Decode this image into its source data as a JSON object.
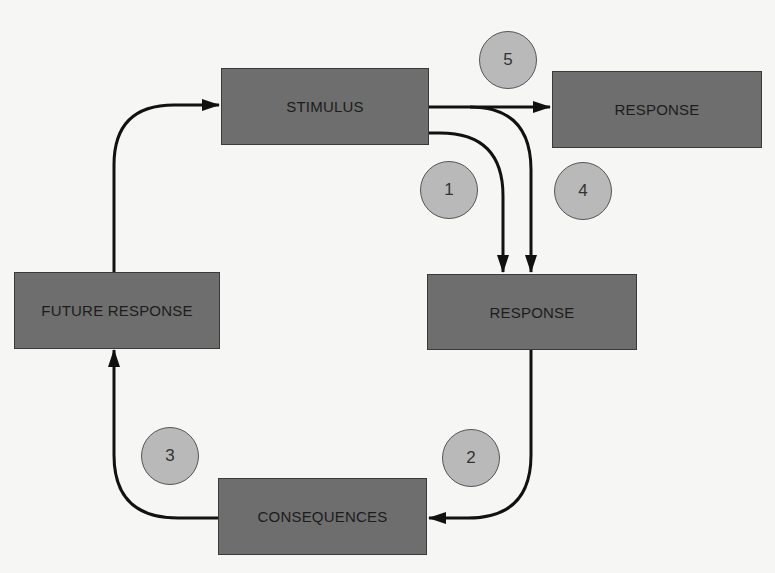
{
  "diagram": {
    "colors": {
      "background": "#f6f6f4",
      "box_fill": "#6e6e6e",
      "box_border": "#3a3a3a",
      "circle_fill": "#b9b9b9",
      "arrow": "#111111"
    },
    "boxes": {
      "stimulus": "STIMULUS",
      "response_top": "RESPONSE",
      "response_mid": "RESPONSE",
      "future_response": "FUTURE RESPONSE",
      "consequences": "CONSEQUENCES"
    },
    "markers": {
      "m1": "1",
      "m2": "2",
      "m3": "3",
      "m4": "4",
      "m5": "5"
    },
    "connections": [
      {
        "from": "stimulus",
        "to": "response_top"
      },
      {
        "from": "stimulus",
        "to": "response_mid",
        "label": "1"
      },
      {
        "from": "stimulus",
        "to": "response_mid",
        "label": "4"
      },
      {
        "from": "response_mid",
        "to": "consequences",
        "label": "2"
      },
      {
        "from": "consequences",
        "to": "future_response",
        "label": "3"
      },
      {
        "from": "future_response",
        "to": "stimulus"
      }
    ]
  }
}
